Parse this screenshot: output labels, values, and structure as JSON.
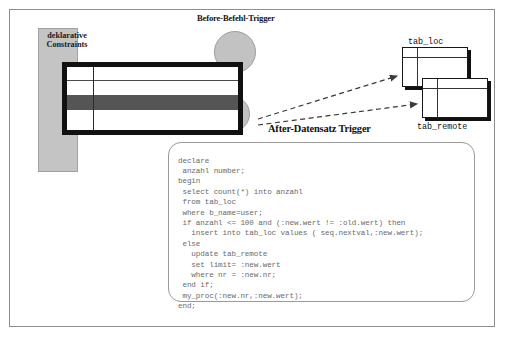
{
  "diagram": {
    "constraints_label": "deklarative\nConstraints",
    "title_before": "Before-Befehl-Trigger",
    "title_after": "After-Datensatz Trigger",
    "table_local_label": "tab_loc",
    "table_remote_label": "tab_remote",
    "code": "declare\n anzahl number;\nbegin\n select count(*) into anzahl\n from tab_loc\n where b_name=user;\n if anzahl <= 100 and (:new.wert != :old.wert) then\n   insert into tab_loc values ( seq.nextval,:new.wert);\n else\n   update tab_remote\n   set limit= :new.wert\n   where nr = :new.nr;\n end if;\n my_proc(:new.nr,:new.wert);\nend;",
    "colors": {
      "frame_border": "#8d8d8d",
      "constraints_fill": "#c4c4c4",
      "circle_fill": "#c2c2c2",
      "table_border": "#111111",
      "highlight_row": "#555555",
      "code_text": "#6a6a6a"
    }
  }
}
